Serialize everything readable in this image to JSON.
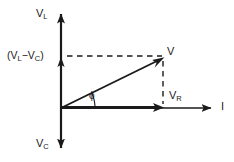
{
  "diagram": {
    "type": "phasor-diagram",
    "title": "",
    "background_color": "#ffffff",
    "stroke_color": "#1a1a1a",
    "axes": {
      "vertical": {
        "positive_label": "V",
        "positive_label_sub": "L",
        "negative_label": "V",
        "negative_label_sub": "C",
        "origin_x": 61,
        "top_y": 10,
        "bottom_y": 152
      },
      "horizontal": {
        "label": "I",
        "origin_y": 108,
        "left_x": 61,
        "right_x": 215
      }
    },
    "labels": {
      "v_l": "V",
      "v_l_sub": "L",
      "v_c": "V",
      "v_c_sub": "C",
      "v_r": "V",
      "v_r_sub": "R",
      "resultant": "V",
      "current": "I",
      "phase_angle": "ϕ",
      "net_reactive_open": "(V",
      "net_reactive_sub1": "L",
      "net_reactive_minus": "−V",
      "net_reactive_sub2": "C",
      "net_reactive_close": ")"
    },
    "vectors": [
      {
        "name": "resultant-voltage",
        "label": "V",
        "from": [
          61,
          108
        ],
        "to": [
          163,
          58
        ],
        "style": "solid",
        "arrowhead": true
      },
      {
        "name": "resistive-voltage",
        "label": "VR",
        "from": [
          61,
          108
        ],
        "to": [
          163,
          108
        ],
        "style": "solid-thick",
        "arrowhead": true
      },
      {
        "name": "net-reactive-voltage",
        "label": "(VL-VC)",
        "from": [
          61,
          108
        ],
        "to": [
          61,
          58
        ],
        "style": "solid",
        "arrowhead": true
      }
    ],
    "construction_lines": [
      {
        "name": "horizontal-projection",
        "from": [
          66,
          56
        ],
        "to": [
          163,
          56
        ],
        "style": "dashed"
      },
      {
        "name": "vertical-projection",
        "from": [
          163,
          60
        ],
        "to": [
          163,
          104
        ],
        "style": "dashed"
      }
    ],
    "angle_arc": {
      "name": "phase-angle-arc",
      "center": [
        61,
        108
      ],
      "radius": 32,
      "from_deg": 0,
      "to_deg": 26,
      "label": "ϕ"
    }
  }
}
